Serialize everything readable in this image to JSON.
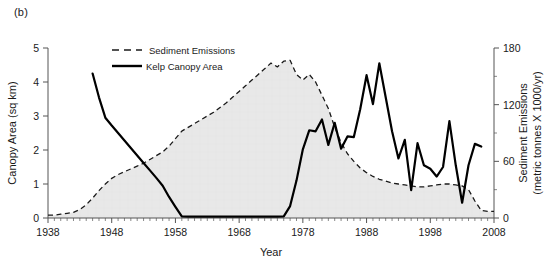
{
  "figure": {
    "panel_label": "(b)"
  },
  "chart_data": {
    "type": "line",
    "title": "",
    "xlabel": "Year",
    "ylabel": "Canopy Area (sq km)",
    "y2label_line1": "Sediment Emissions",
    "y2label_line2": "(metric tonnes X 1000/yr)",
    "xlim": [
      1938,
      2008
    ],
    "ylim": [
      0,
      5
    ],
    "y2lim": [
      0,
      180
    ],
    "xticks": [
      1938,
      1948,
      1958,
      1968,
      1978,
      1988,
      1998,
      2008
    ],
    "xtick_labels": [
      "1938",
      "1948",
      "1958",
      "1968",
      "1978",
      "1988",
      "1998",
      "2008"
    ],
    "yticks": [
      0,
      1,
      2,
      3,
      4,
      5
    ],
    "ytick_labels": [
      "0",
      "1",
      "2",
      "3",
      "4",
      "5"
    ],
    "y2ticks": [
      0,
      60,
      120,
      180
    ],
    "y2tick_labels": [
      "0",
      "60",
      "120",
      "180"
    ],
    "minor_ticks": true,
    "grid": false,
    "legend_position": "upper-center",
    "series": [
      {
        "name": "Sediment Emissions",
        "axis": "right",
        "style": "dashed",
        "color": "#1a1a1a",
        "fill": "#e8e8e8",
        "units": "metric tonnes X 1000/yr",
        "x": [
          1938,
          1939,
          1940,
          1941,
          1942,
          1943,
          1944,
          1945,
          1946,
          1947,
          1948,
          1949,
          1950,
          1951,
          1952,
          1953,
          1954,
          1955,
          1956,
          1957,
          1958,
          1959,
          1960,
          1961,
          1962,
          1963,
          1964,
          1965,
          1966,
          1967,
          1968,
          1969,
          1970,
          1971,
          1972,
          1973,
          1974,
          1975,
          1976,
          1977,
          1978,
          1979,
          1980,
          1981,
          1982,
          1983,
          1984,
          1985,
          1986,
          1987,
          1988,
          1989,
          1990,
          1991,
          1992,
          1993,
          1994,
          1995,
          1996,
          1997,
          1998,
          1999,
          2000,
          2001,
          2002,
          2003,
          2004,
          2005,
          2006,
          2007,
          2008
        ],
        "y": [
          3,
          3,
          4,
          5,
          6,
          9,
          14,
          21,
          29,
          36,
          42,
          46,
          49,
          52,
          55,
          58,
          62,
          66,
          70,
          76,
          84,
          92,
          96,
          100,
          104,
          108,
          112,
          117,
          122,
          128,
          134,
          140,
          146,
          152,
          158,
          164,
          160,
          166,
          167,
          152,
          146,
          152,
          144,
          130,
          116,
          96,
          80,
          68,
          60,
          53,
          48,
          44,
          41,
          39,
          37,
          36,
          35,
          34,
          33,
          33,
          34,
          35,
          36,
          36,
          35,
          34,
          30,
          18,
          8,
          7,
          7
        ]
      },
      {
        "name": "Kelp Canopy Area",
        "axis": "left",
        "style": "solid",
        "color": "#000000",
        "units": "sq km",
        "x": [
          1945,
          1946,
          1947,
          1948,
          1949,
          1950,
          1951,
          1952,
          1953,
          1954,
          1955,
          1956,
          1957,
          1958,
          1959,
          1960,
          1961,
          1962,
          1963,
          1964,
          1965,
          1966,
          1967,
          1968,
          1969,
          1970,
          1971,
          1972,
          1973,
          1974,
          1975,
          1976,
          1977,
          1978,
          1979,
          1980,
          1981,
          1982,
          1983,
          1984,
          1985,
          1986,
          1987,
          1988,
          1989,
          1990,
          1991,
          1992,
          1993,
          1994,
          1995,
          1996,
          1997,
          1998,
          1999,
          2000,
          2001,
          2002,
          2003,
          2004,
          2005,
          2006
        ],
        "y": [
          4.25,
          3.55,
          2.95,
          2.72,
          2.5,
          2.28,
          2.06,
          1.84,
          1.62,
          1.4,
          1.18,
          0.95,
          0.62,
          0.33,
          0.05,
          0.04,
          0.04,
          0.04,
          0.04,
          0.04,
          0.04,
          0.04,
          0.04,
          0.04,
          0.04,
          0.04,
          0.04,
          0.04,
          0.04,
          0.04,
          0.05,
          0.35,
          1.1,
          2.02,
          2.58,
          2.55,
          2.9,
          2.15,
          2.8,
          2.04,
          2.4,
          2.38,
          3.2,
          4.2,
          3.35,
          4.55,
          3.55,
          2.55,
          1.75,
          2.3,
          0.82,
          2.2,
          1.55,
          1.45,
          1.22,
          1.5,
          2.85,
          1.55,
          0.45,
          1.55,
          2.18,
          2.1
        ]
      }
    ],
    "legend_entries": [
      {
        "label": "Sediment Emissions",
        "style": "dashed"
      },
      {
        "label": "Kelp Canopy Area",
        "style": "solid"
      }
    ]
  }
}
